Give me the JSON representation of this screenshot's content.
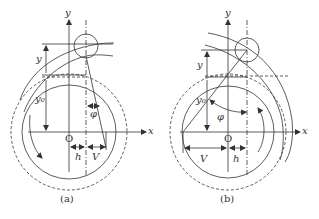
{
  "figure": {
    "panels": [
      {
        "id": "a",
        "caption": "(a)",
        "labels": {
          "y_axis": "y",
          "x_axis": "x",
          "origin": "O",
          "displacement": "y",
          "base_offset": "y₀",
          "angle": "φ",
          "offset_h": "h",
          "offset_v": "V"
        }
      },
      {
        "id": "b",
        "caption": "(b)",
        "labels": {
          "y_axis": "y",
          "x_axis": "x",
          "origin": "O",
          "displacement": "y",
          "base_offset": "y₀",
          "angle": "φ",
          "offset_h": "h",
          "offset_v": "V"
        }
      }
    ],
    "colors": {
      "line": "#333333",
      "background": "#ffffff"
    }
  }
}
